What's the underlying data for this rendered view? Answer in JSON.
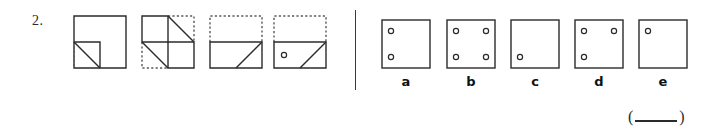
{
  "question": {
    "number": "2.",
    "answer_prefix": "(",
    "answer_suffix": ")",
    "answer_value": ""
  },
  "colors": {
    "stroke_solid": "#2b2b2b",
    "stroke_dotted": "#5a5a5a",
    "background": "#ffffff",
    "divider": "#3a3a3a",
    "label": "#111111"
  },
  "sequence": {
    "figures": [
      {
        "name": "figure-1",
        "description": "Square with dotted lower-left quadrant cut by a diagonal fold line",
        "size": 52,
        "solid_outline": true,
        "dotted_regions": [
          "lower-left-quadrant"
        ],
        "diagonals": [
          "lower-left-quadrant-anti-diagonal"
        ],
        "holes": []
      },
      {
        "name": "figure-2",
        "description": "Square divided into four quadrants with dotted upper-right and lower-left quadrants, each crossed by a diagonal",
        "size": 52,
        "solid_outline": false,
        "dotted_regions": [
          "upper-right-quadrant",
          "lower-left-quadrant"
        ],
        "diagonals": [
          "upper-right-quadrant-anti-diagonal",
          "lower-left-quadrant-anti-diagonal"
        ],
        "holes": []
      },
      {
        "name": "figure-3",
        "description": "Solid lower-half rectangle with a diagonal, dotted upper-half rectangle",
        "size": 52,
        "solid_outline": false,
        "dotted_regions": [
          "upper-half"
        ],
        "diagonals": [
          "lower-half-right-diagonal"
        ],
        "holes": []
      },
      {
        "name": "figure-4",
        "description": "Solid lower-half rectangle with a diagonal and a punched hole at left, dotted upper-half rectangle",
        "size": 52,
        "solid_outline": false,
        "dotted_regions": [
          "upper-half"
        ],
        "diagonals": [
          "lower-half-right-diagonal"
        ],
        "holes": [
          "lower-half-left"
        ]
      }
    ]
  },
  "options": {
    "items": [
      {
        "label": "a",
        "name": "option-a",
        "hole_positions": [
          "upper-left",
          "lower-left"
        ]
      },
      {
        "label": "b",
        "name": "option-b",
        "hole_positions": [
          "upper-left",
          "upper-right",
          "lower-left",
          "lower-right"
        ]
      },
      {
        "label": "c",
        "name": "option-c",
        "hole_positions": [
          "lower-left"
        ]
      },
      {
        "label": "d",
        "name": "option-d",
        "hole_positions": [
          "upper-left",
          "upper-right",
          "lower-left"
        ]
      },
      {
        "label": "e",
        "name": "option-e",
        "hole_positions": [
          "upper-left"
        ]
      }
    ]
  }
}
